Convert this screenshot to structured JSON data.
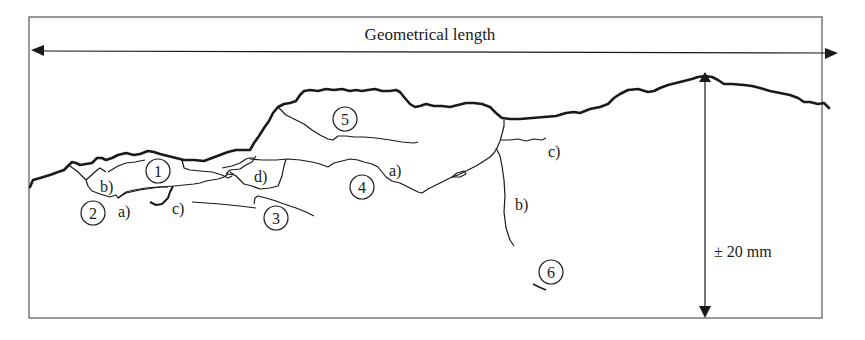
{
  "diagram": {
    "title": "Geometrical length",
    "scale_label": "± 20 mm",
    "colors": {
      "line": "#1a1a1a",
      "frame": "#555555",
      "background": "#ffffff"
    },
    "zones": [
      {
        "id": "1",
        "label": "1"
      },
      {
        "id": "2",
        "label": "2"
      },
      {
        "id": "3",
        "label": "3"
      },
      {
        "id": "4",
        "label": "4"
      },
      {
        "id": "5",
        "label": "5"
      },
      {
        "id": "6",
        "label": "6"
      }
    ],
    "crack_labels": {
      "zone2_a": "a)",
      "zone2_b": "b)",
      "zone2_c": "c)",
      "zone2_d": "d)",
      "zone4_a": "a)",
      "zone4_b": "b)",
      "zone4_c": "c)"
    }
  }
}
